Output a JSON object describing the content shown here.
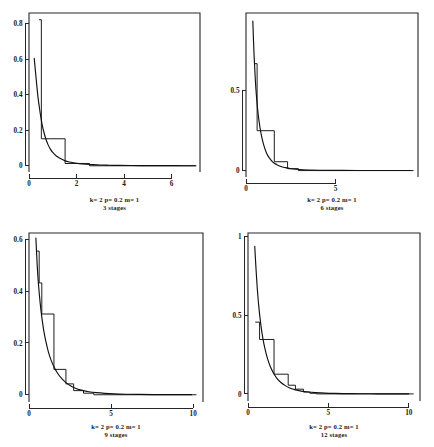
{
  "figure": {
    "title": "",
    "panel_count": 4,
    "layout": "2x2 grid of small multiples"
  },
  "chart_data": [
    {
      "id": "panel-1",
      "type": "line",
      "title": "",
      "caption_line1": "k= 2   p= 0.2   m= 1",
      "caption_line2": "3 stages",
      "xlabel": "",
      "ylabel": "",
      "xlim": [
        0,
        7.2
      ],
      "ylim": [
        -0.035,
        0.86
      ],
      "xticks": [
        0,
        2,
        4,
        6
      ],
      "xticklabels": [
        "0",
        "2",
        "4",
        "6"
      ],
      "yticks": [
        0,
        0.2,
        0.4,
        0.6,
        0.8
      ],
      "yticklabels": [
        "0",
        "0.2",
        "0.4",
        "0.6",
        "0.8"
      ],
      "grid": false,
      "legend": "none",
      "series": [
        {
          "name": "density",
          "kind": "smooth-curve",
          "x": [
            0.22,
            0.28,
            0.33,
            0.38,
            0.44,
            0.5,
            0.56,
            0.62,
            0.7,
            0.8,
            0.9,
            1.0,
            1.15,
            1.3,
            1.5,
            1.7,
            1.9,
            2.1,
            2.4,
            2.7,
            3.0,
            3.4,
            3.8,
            4.3,
            4.9,
            5.5,
            6.2,
            7.0
          ],
          "y": [
            0.605,
            0.52,
            0.45,
            0.385,
            0.325,
            0.272,
            0.228,
            0.193,
            0.155,
            0.119,
            0.094,
            0.075,
            0.055,
            0.042,
            0.029,
            0.021,
            0.016,
            0.012,
            0.0085,
            0.0062,
            0.0045,
            0.003,
            0.0022,
            0.0015,
            0.001,
            0.0007,
            0.0005,
            0.0003
          ]
        },
        {
          "name": "stage-approximation",
          "kind": "step",
          "edges": [
            0.42,
            0.52,
            1.52,
            2.55,
            7.05
          ],
          "levels": [
            0.822,
            0.152,
            0.013,
            0.0
          ]
        }
      ]
    },
    {
      "id": "panel-2",
      "type": "line",
      "title": "",
      "caption_line1": "k= 2   p= 0.2   m= 1",
      "caption_line2": "6 stages",
      "xlabel": "",
      "ylabel": "",
      "xlim": [
        0,
        9.6
      ],
      "ylim": [
        -0.04,
        0.98
      ],
      "xticks": [
        0,
        5
      ],
      "xticklabels": [
        "0",
        "5"
      ],
      "yticks": [
        0,
        0.5
      ],
      "yticklabels": [
        "0",
        "0.5"
      ],
      "grid": false,
      "legend": "none",
      "series": [
        {
          "name": "density",
          "kind": "smooth-curve",
          "x": [
            0.38,
            0.45,
            0.52,
            0.6,
            0.68,
            0.78,
            0.88,
            1.0,
            1.15,
            1.3,
            1.5,
            1.7,
            1.95,
            2.2,
            2.5,
            2.8,
            3.2,
            3.6,
            4.1,
            4.7,
            5.4,
            6.2,
            7.1,
            8.1,
            9.2
          ],
          "y": [
            0.93,
            0.72,
            0.565,
            0.44,
            0.35,
            0.268,
            0.208,
            0.155,
            0.108,
            0.079,
            0.053,
            0.038,
            0.025,
            0.018,
            0.0115,
            0.008,
            0.005,
            0.0035,
            0.0022,
            0.0014,
            0.0009,
            0.0006,
            0.0004,
            0.00025,
            0.00015
          ]
        },
        {
          "name": "stage-approximation",
          "kind": "step",
          "edges": [
            0.48,
            0.62,
            1.58,
            2.32,
            2.92,
            9.35
          ],
          "levels": [
            0.665,
            0.248,
            0.055,
            0.012,
            0.0
          ]
        }
      ]
    },
    {
      "id": "panel-3",
      "type": "line",
      "title": "",
      "caption_line1": "k= 2   p= 0.2   m= 1",
      "caption_line2": "9 stages",
      "xlabel": "",
      "ylabel": "",
      "xlim": [
        0,
        10.6
      ],
      "ylim": [
        -0.028,
        0.625
      ],
      "xticks": [
        0,
        5,
        10
      ],
      "xticklabels": [
        "0",
        "5",
        "10"
      ],
      "yticks": [
        0,
        0.2,
        0.4,
        0.6
      ],
      "yticklabels": [
        "0",
        "0.2",
        "0.4",
        "0.6"
      ],
      "grid": false,
      "legend": "none",
      "series": [
        {
          "name": "density",
          "kind": "smooth-curve",
          "x": [
            0.42,
            0.5,
            0.58,
            0.68,
            0.78,
            0.9,
            1.02,
            1.18,
            1.35,
            1.55,
            1.75,
            2.0,
            2.25,
            2.55,
            2.9,
            3.25,
            3.65,
            4.1,
            4.6,
            5.2,
            5.9,
            6.7,
            7.6,
            8.6,
            9.9
          ],
          "y": [
            0.605,
            0.5,
            0.425,
            0.355,
            0.3,
            0.248,
            0.208,
            0.166,
            0.133,
            0.104,
            0.082,
            0.062,
            0.047,
            0.034,
            0.0235,
            0.0168,
            0.0118,
            0.0082,
            0.0055,
            0.0034,
            0.0021,
            0.0013,
            0.0008,
            0.0005,
            0.0003
          ]
        },
        {
          "name": "stage-approximation",
          "kind": "step",
          "edges": [
            0.45,
            0.62,
            0.78,
            1.52,
            2.25,
            2.72,
            3.32,
            3.95,
            10.2
          ],
          "levels": [
            0.555,
            0.432,
            0.312,
            0.098,
            0.042,
            0.016,
            0.006,
            0.0
          ]
        }
      ]
    },
    {
      "id": "panel-4",
      "type": "line",
      "title": "",
      "caption_line1": "k= 2   p= 0.2   m= 1",
      "caption_line2": "12 stages",
      "xlabel": "",
      "ylabel": "",
      "xlim": [
        0,
        10.7
      ],
      "ylim": [
        -0.045,
        1.02
      ],
      "xticks": [
        0,
        5,
        10
      ],
      "xticklabels": [
        "0",
        "5",
        "10"
      ],
      "yticks": [
        0,
        0.5,
        1
      ],
      "yticklabels": [
        "0",
        "0.5",
        "1"
      ],
      "grid": false,
      "legend": "none",
      "series": [
        {
          "name": "density",
          "kind": "smooth-curve",
          "x": [
            0.42,
            0.5,
            0.58,
            0.68,
            0.8,
            0.92,
            1.05,
            1.2,
            1.38,
            1.58,
            1.8,
            2.05,
            2.3,
            2.6,
            2.95,
            3.3,
            3.75,
            4.2,
            4.8,
            5.4,
            6.2,
            7.0,
            8.0,
            9.0,
            10.0
          ],
          "y": [
            0.935,
            0.79,
            0.665,
            0.545,
            0.438,
            0.355,
            0.288,
            0.228,
            0.175,
            0.133,
            0.099,
            0.072,
            0.054,
            0.038,
            0.0255,
            0.018,
            0.0118,
            0.008,
            0.0047,
            0.003,
            0.0017,
            0.001,
            0.0006,
            0.0004,
            0.0002
          ]
        },
        {
          "name": "stage-approximation",
          "kind": "step",
          "edges": [
            0.45,
            0.72,
            0.95,
            1.62,
            2.5,
            2.95,
            3.45,
            3.85,
            4.25,
            10.3
          ],
          "levels": [
            0.455,
            0.345,
            0.345,
            0.125,
            0.055,
            0.03,
            0.012,
            0.004,
            0.0
          ]
        }
      ]
    }
  ],
  "panels": [
    {
      "name": "top-left",
      "stages": "3 stages",
      "params": "k= 2   p= 0.2   m= 1"
    },
    {
      "name": "top-right",
      "stages": "6 stages",
      "params": "k= 2   p= 0.2   m= 1"
    },
    {
      "name": "bottom-left",
      "stages": "9 stages",
      "params": "k= 2   p= 0.2   m= 1"
    },
    {
      "name": "bottom-right",
      "stages": "12 stages",
      "params": "k= 2   p= 0.2   m= 1"
    }
  ],
  "colors": {
    "ink": "#111111",
    "axis": "#262626",
    "background": "#ffffff"
  }
}
